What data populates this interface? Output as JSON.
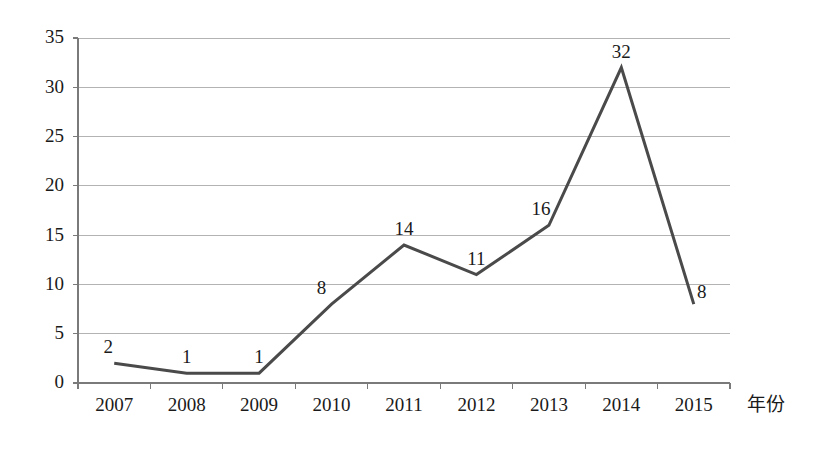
{
  "chart_data": {
    "type": "line",
    "title": "",
    "xlabel": "年份",
    "ylabel": "",
    "categories": [
      "2007",
      "2008",
      "2009",
      "2010",
      "2011",
      "2012",
      "2013",
      "2014",
      "2015"
    ],
    "values": [
      2,
      1,
      1,
      8,
      14,
      11,
      16,
      32,
      8
    ],
    "point_labels": [
      "2",
      "1",
      "1",
      "8",
      "14",
      "11",
      "16",
      "32",
      "8"
    ],
    "ylim": [
      0,
      35
    ],
    "ytick_labels": [
      "0",
      "5",
      "10",
      "15",
      "20",
      "25",
      "30",
      "35"
    ],
    "ytick_values": [
      0,
      5,
      10,
      15,
      20,
      25,
      30,
      35
    ],
    "grid": true,
    "legend": false,
    "series_name": "",
    "line_color": "#4a4a4a",
    "grid_color": "#b3b3b3",
    "axis_color": "#7a7a7a",
    "text_color": "#1a1a1a"
  }
}
